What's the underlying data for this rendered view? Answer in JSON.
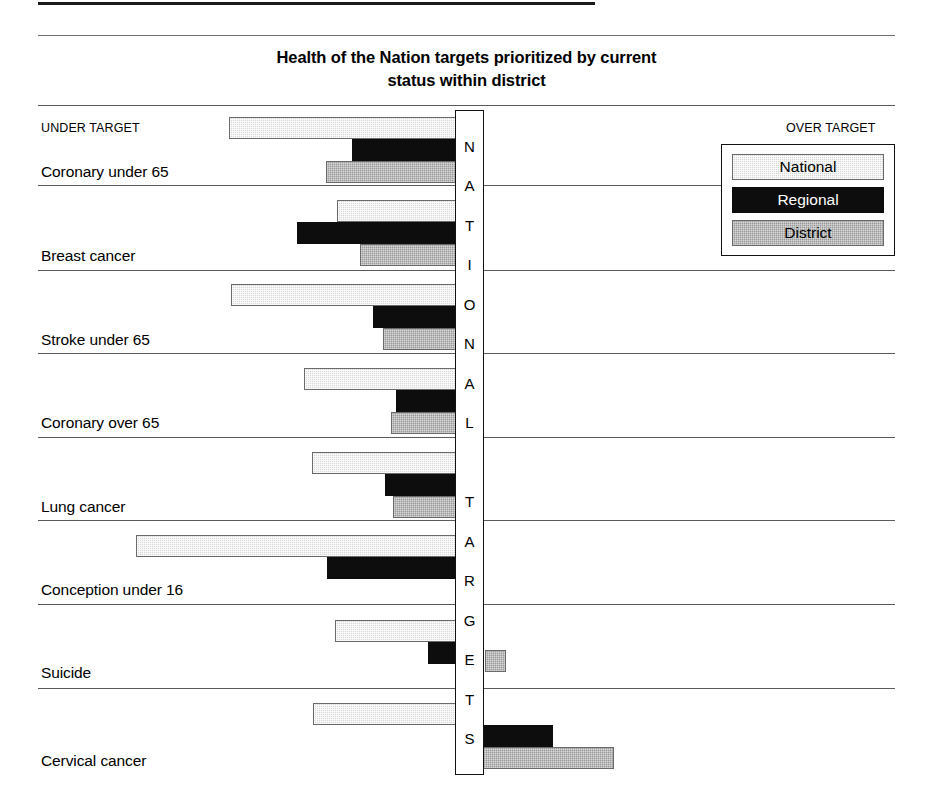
{
  "chart_title": "Health of the Nation targets prioritized by current\nstatus within district",
  "captions": {
    "under_target": "UNDER TARGET",
    "over_target": "OVER TARGET",
    "center_axis": "NATIONAL TARGETS"
  },
  "legend": {
    "position": "top-right",
    "items": [
      {
        "label": "National",
        "color": "#d8d8d8"
      },
      {
        "label": "Regional",
        "color": "#0d0d0d"
      },
      {
        "label": "District",
        "color": "#9a9a9a"
      }
    ]
  },
  "chart_data": {
    "type": "bar",
    "orientation": "horizontal",
    "xlabel": "",
    "ylabel": "",
    "axis_note": "Bars diverge from a central NATIONAL TARGETS axis; left = UNDER TARGET, right = OVER TARGET",
    "xlim": [
      -100,
      60
    ],
    "grid": false,
    "categories": [
      "Coronary under 65",
      "Breast cancer",
      "Stroke under 65",
      "Coronary over 65",
      "Lung cancer",
      "Conception under 16",
      "Suicide",
      "Cervical cancer"
    ],
    "series": [
      {
        "name": "National",
        "color": "#d8d8d8",
        "values": [
          -70,
          -37,
          -69,
          -46,
          -44,
          -98,
          -37,
          -44
        ]
      },
      {
        "name": "Regional",
        "color": "#0d0d0d",
        "values": [
          -39,
          -62,
          -31,
          -22,
          -26,
          -41,
          -11,
          26
        ]
      },
      {
        "name": "District",
        "color": "#9a9a9a",
        "values": [
          -48,
          -30,
          -27,
          -24,
          -23,
          -1,
          7,
          45
        ]
      }
    ]
  },
  "rows": [
    {
      "label": "Coronary under 65",
      "bars": [
        {
          "series": "National",
          "left": 229,
          "right": 461,
          "top": 117
        },
        {
          "series": "Regional",
          "left": 352,
          "right": 461,
          "top": 139
        },
        {
          "series": "District",
          "left": 326,
          "right": 461,
          "top": 161
        }
      ]
    },
    {
      "label": "Breast cancer",
      "bars": [
        {
          "series": "National",
          "left": 337,
          "right": 461,
          "top": 200
        },
        {
          "series": "Regional",
          "left": 297,
          "right": 461,
          "top": 222
        },
        {
          "series": "District",
          "left": 360,
          "right": 461,
          "top": 244
        }
      ]
    },
    {
      "label": "Stroke under 65",
      "bars": [
        {
          "series": "National",
          "left": 231,
          "right": 461,
          "top": 284
        },
        {
          "series": "Regional",
          "left": 373,
          "right": 461,
          "top": 306
        },
        {
          "series": "District",
          "left": 383,
          "right": 461,
          "top": 328
        }
      ]
    },
    {
      "label": "Coronary over 65",
      "bars": [
        {
          "series": "National",
          "left": 304,
          "right": 461,
          "top": 368
        },
        {
          "series": "Regional",
          "left": 396,
          "right": 461,
          "top": 390
        },
        {
          "series": "District",
          "left": 391,
          "right": 461,
          "top": 412
        }
      ]
    },
    {
      "label": "Lung cancer",
      "bars": [
        {
          "series": "National",
          "left": 312,
          "right": 461,
          "top": 452
        },
        {
          "series": "Regional",
          "left": 385,
          "right": 461,
          "top": 474
        },
        {
          "series": "District",
          "left": 393,
          "right": 461,
          "top": 496
        }
      ]
    },
    {
      "label": "Conception under 16",
      "bars": [
        {
          "series": "National",
          "left": 136,
          "right": 461,
          "top": 535
        },
        {
          "series": "Regional",
          "left": 327,
          "right": 461,
          "top": 557
        },
        {
          "series": "District",
          "left": 455,
          "right": 484,
          "top": 565
        }
      ]
    },
    {
      "label": "Suicide",
      "bars": [
        {
          "series": "National",
          "left": 335,
          "right": 461,
          "top": 620
        },
        {
          "series": "Regional",
          "left": 428,
          "right": 461,
          "top": 642
        },
        {
          "series": "District",
          "left": 485,
          "right": 506,
          "top": 650
        }
      ]
    },
    {
      "label": "Cervical cancer",
      "bars": [
        {
          "series": "National",
          "left": 313,
          "right": 461,
          "top": 703
        },
        {
          "series": "Regional",
          "left": 478,
          "right": 553,
          "top": 725
        },
        {
          "series": "District",
          "left": 478,
          "right": 614,
          "top": 747
        }
      ]
    }
  ],
  "row_label_tops": [
    163,
    247,
    331,
    414,
    498,
    581,
    664,
    752
  ],
  "separator_tops": [
    105,
    185,
    270,
    353,
    437,
    520,
    604,
    688
  ]
}
